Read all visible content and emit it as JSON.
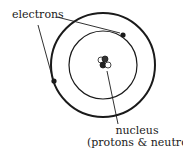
{
  "diagram": {
    "labels": {
      "electrons": "electrons",
      "nucleus": "nucleus",
      "nucleus_detail": "(protons & neutrons)"
    },
    "components": {
      "outer_orbit": {
        "cx": 103,
        "cy": 65,
        "r": 52
      },
      "inner_orbit": {
        "cx": 103,
        "cy": 65,
        "r": 34
      },
      "electron_1": {
        "x": 123,
        "y": 35
      },
      "electron_2": {
        "x": 54,
        "y": 81
      },
      "nucleus_center": {
        "x": 105,
        "y": 63
      }
    },
    "colors": {
      "stroke": "#1a1a1a",
      "background": "#ffffff"
    }
  }
}
